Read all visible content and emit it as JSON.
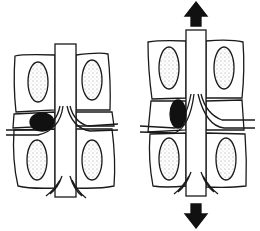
{
  "diagram": {
    "panels": [
      {
        "id": "left",
        "description": "spinal segment with compressed disc and herniation pressing on nerve root"
      },
      {
        "id": "right",
        "description": "spinal segment under traction with widened disc space"
      }
    ],
    "colors": {
      "stroke": "#1a1a1a",
      "fill": "#ffffff",
      "herniation": "#111111",
      "arrow": "#111111"
    },
    "arrows": [
      {
        "direction": "up",
        "panel": "right"
      },
      {
        "direction": "down",
        "panel": "right"
      }
    ]
  }
}
